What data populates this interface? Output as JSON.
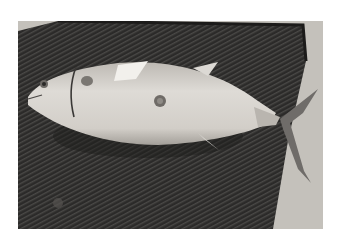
{
  "photo": {
    "description": "Grayscale photograph of a tuna-like fish lying on a dark ribbed rubber mat",
    "colors": {
      "background_floor": "#c9c6c0",
      "mat": "#2e2d2c",
      "mat_ridge": "#454442",
      "fish_body": "#d6d3ce",
      "fish_shadow": "#a9a5a0",
      "fin": "#6e6b68"
    }
  }
}
